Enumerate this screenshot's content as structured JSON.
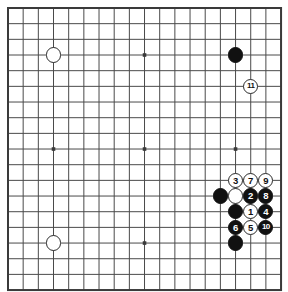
{
  "app": {
    "title": "Go Board Diagram",
    "kind": "go-board-diagram"
  },
  "board": {
    "name": "go-board",
    "columns": 18,
    "rows": 18,
    "origin_x": 8,
    "origin_y": 8,
    "cell_w": 15.17,
    "cell_h": 15.67,
    "line_color": "#4a4a4a",
    "border_color": "#3a3a3a",
    "background_color": "#ffffff",
    "border_width": 2,
    "line_width": 1,
    "stone_radius": 7.6,
    "star_points": [
      {
        "name": "star-point-top-left",
        "col": 3,
        "row": 3
      },
      {
        "name": "star-point-top-center",
        "col": 9,
        "row": 3
      },
      {
        "name": "star-point-top-right",
        "col": 15,
        "row": 3
      },
      {
        "name": "star-point-middle-left",
        "col": 3,
        "row": 9
      },
      {
        "name": "star-point-center",
        "col": 9,
        "row": 9
      },
      {
        "name": "star-point-middle-right",
        "col": 15,
        "row": 9
      },
      {
        "name": "star-point-bottom-center",
        "col": 9,
        "row": 15
      }
    ]
  },
  "stones": [
    {
      "id": "white-stone-upper-left",
      "color": "white",
      "col": 3,
      "row": 3,
      "label": ""
    },
    {
      "id": "white-stone-lower-left",
      "color": "white",
      "col": 3,
      "row": 15,
      "label": ""
    },
    {
      "id": "black-stone-upper-right",
      "color": "black",
      "col": 15,
      "row": 3,
      "label": ""
    },
    {
      "id": "white-move-11",
      "color": "white",
      "col": 16,
      "row": 5,
      "label": "11"
    },
    {
      "id": "white-move-3",
      "color": "white",
      "col": 15,
      "row": 11,
      "label": "3"
    },
    {
      "id": "white-move-7",
      "color": "white",
      "col": 16,
      "row": 11,
      "label": "7"
    },
    {
      "id": "white-move-9",
      "color": "white",
      "col": 17,
      "row": 11,
      "label": "9"
    },
    {
      "id": "black-stone-left-wall",
      "color": "black",
      "col": 14,
      "row": 12,
      "label": ""
    },
    {
      "id": "white-stone-captured-shape",
      "color": "white",
      "col": 15,
      "row": 12,
      "label": ""
    },
    {
      "id": "black-move-2",
      "color": "black",
      "col": 16,
      "row": 12,
      "label": "2"
    },
    {
      "id": "black-move-8",
      "color": "black",
      "col": 17,
      "row": 12,
      "label": "8"
    },
    {
      "id": "black-stone-center-wall",
      "color": "black",
      "col": 15,
      "row": 13,
      "label": ""
    },
    {
      "id": "white-move-1",
      "color": "white",
      "col": 16,
      "row": 13,
      "label": "1"
    },
    {
      "id": "black-move-4",
      "color": "black",
      "col": 17,
      "row": 13,
      "label": "4"
    },
    {
      "id": "black-move-6",
      "color": "black",
      "col": 15,
      "row": 14,
      "label": "6"
    },
    {
      "id": "white-move-5",
      "color": "white",
      "col": 16,
      "row": 14,
      "label": "5"
    },
    {
      "id": "black-move-10",
      "color": "black",
      "col": 17,
      "row": 14,
      "label": "10"
    },
    {
      "id": "black-stone-bottom",
      "color": "black",
      "col": 15,
      "row": 15,
      "label": ""
    }
  ],
  "move_sequence": {
    "label": "Move order",
    "moves": [
      "1",
      "2",
      "3",
      "4",
      "5",
      "6",
      "7",
      "8",
      "9",
      "10",
      "11"
    ]
  },
  "colors": {
    "black_stone": "#111111",
    "white_stone": "#ffffff",
    "stone_outline": "#2a2a2a",
    "grid_line": "#4a4a4a",
    "board_border": "#3a3a3a",
    "board_bg": "#ffffff"
  }
}
